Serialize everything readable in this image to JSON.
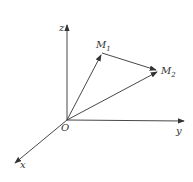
{
  "diagram": {
    "title": "",
    "axes": {
      "x": {
        "label": "x"
      },
      "y": {
        "label": "y"
      },
      "z": {
        "label": "z"
      }
    },
    "origin": {
      "label": "O"
    },
    "points": [
      {
        "name": "M",
        "sub": "1"
      },
      {
        "name": "M",
        "sub": "2"
      }
    ],
    "colors": {
      "line": "#333333",
      "background": "#ffffff"
    }
  }
}
